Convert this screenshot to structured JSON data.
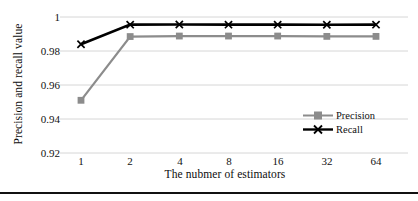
{
  "chart_data": {
    "type": "line",
    "title": "",
    "xlabel": "The nubmer of estimators",
    "ylabel": "Precision and recall value",
    "categories": [
      "1",
      "2",
      "4",
      "8",
      "16",
      "32",
      "64"
    ],
    "x": [
      1,
      2,
      4,
      8,
      16,
      32,
      64
    ],
    "xscale": "category",
    "ylim": [
      0.92,
      1.0
    ],
    "yticks": [
      "0.92",
      "0.94",
      "0.96",
      "0.98",
      "1"
    ],
    "ytick_values": [
      0.92,
      0.94,
      0.96,
      0.98,
      1.0
    ],
    "grid": "horizontal",
    "legend_position": "center-right",
    "series": [
      {
        "name": "Precision",
        "color": "#8c8c8c",
        "marker": "square",
        "values": [
          0.951,
          0.9885,
          0.9888,
          0.9888,
          0.9888,
          0.9886,
          0.9886
        ]
      },
      {
        "name": "Recall",
        "color": "#000000",
        "marker": "x",
        "values": [
          0.984,
          0.9955,
          0.9956,
          0.9955,
          0.9955,
          0.9954,
          0.9955
        ]
      }
    ]
  },
  "axis": {
    "y_title": "Precision and recall value",
    "x_title": "The nubmer of estimators",
    "y_tick_labels": [
      "1",
      "0.98",
      "0.96",
      "0.94",
      "0.92"
    ],
    "x_tick_labels": [
      "1",
      "2",
      "4",
      "8",
      "16",
      "32",
      "64"
    ]
  },
  "legend": {
    "items": [
      {
        "label": "Precision",
        "icon": "square-marker-line-icon"
      },
      {
        "label": "Recall",
        "icon": "x-marker-line-icon"
      }
    ]
  },
  "colors": {
    "precision": "#8c8c8c",
    "recall": "#000000",
    "grid": "#d6d6d6",
    "text": "#111111",
    "rule": "#111111"
  }
}
